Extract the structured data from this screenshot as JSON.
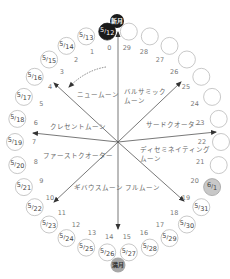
{
  "colors": {
    "new_moon": "#1a1a1a",
    "full_moon": "#a8a8a8",
    "highlight_date": "#c8c8c8",
    "circle_stroke": "#b0b0b0",
    "arrow": "#444444"
  },
  "markers": {
    "new_moon": "新月",
    "full_moon": "満月"
  },
  "days": [
    {
      "day": "0",
      "date_month": "5",
      "date_day": "12",
      "style": "dark"
    },
    {
      "day": "1",
      "date_month": "5",
      "date_day": "13",
      "style": "normal"
    },
    {
      "day": "2",
      "date_month": "5",
      "date_day": "14",
      "style": "normal"
    },
    {
      "day": "3",
      "date_month": "5",
      "date_day": "15",
      "style": "normal"
    },
    {
      "day": "4",
      "date_month": "5",
      "date_day": "16",
      "style": "normal"
    },
    {
      "day": "5",
      "date_month": "5",
      "date_day": "17",
      "style": "normal"
    },
    {
      "day": "6",
      "date_month": "5",
      "date_day": "18",
      "style": "normal"
    },
    {
      "day": "7",
      "date_month": "5",
      "date_day": "19",
      "style": "normal"
    },
    {
      "day": "8",
      "date_month": "5",
      "date_day": "20",
      "style": "normal"
    },
    {
      "day": "9",
      "date_month": "5",
      "date_day": "21",
      "style": "normal"
    },
    {
      "day": "10",
      "date_month": "5",
      "date_day": "22",
      "style": "normal"
    },
    {
      "day": "11",
      "date_month": "5",
      "date_day": "23",
      "style": "normal"
    },
    {
      "day": "12",
      "date_month": "5",
      "date_day": "24",
      "style": "normal"
    },
    {
      "day": "13",
      "date_month": "5",
      "date_day": "25",
      "style": "normal"
    },
    {
      "day": "14",
      "date_month": "5",
      "date_day": "26",
      "style": "normal"
    },
    {
      "day": "15",
      "date_month": "5",
      "date_day": "27",
      "style": "normal"
    },
    {
      "day": "16",
      "date_month": "5",
      "date_day": "28",
      "style": "normal"
    },
    {
      "day": "17",
      "date_month": "5",
      "date_day": "29",
      "style": "normal"
    },
    {
      "day": "18",
      "date_month": "5",
      "date_day": "30",
      "style": "normal"
    },
    {
      "day": "19",
      "date_month": "5",
      "date_day": "31",
      "style": "normal"
    },
    {
      "day": "20",
      "date_month": "6",
      "date_day": "1",
      "style": "highlight"
    },
    {
      "day": "21",
      "date_month": "",
      "date_day": "",
      "style": "empty"
    },
    {
      "day": "22",
      "date_month": "",
      "date_day": "",
      "style": "empty"
    },
    {
      "day": "23",
      "date_month": "",
      "date_day": "",
      "style": "empty"
    },
    {
      "day": "24",
      "date_month": "",
      "date_day": "",
      "style": "empty"
    },
    {
      "day": "25",
      "date_month": "",
      "date_day": "",
      "style": "empty"
    },
    {
      "day": "26",
      "date_month": "",
      "date_day": "",
      "style": "empty"
    },
    {
      "day": "27",
      "date_month": "",
      "date_day": "",
      "style": "empty"
    },
    {
      "day": "28",
      "date_month": "",
      "date_day": "",
      "style": "empty"
    },
    {
      "day": "29",
      "date_month": "",
      "date_day": "",
      "style": "empty"
    }
  ],
  "phases": [
    {
      "id": "new-moon",
      "lines": [
        "ニュームーン"
      ]
    },
    {
      "id": "crescent",
      "lines": [
        "クレセントムーン"
      ]
    },
    {
      "id": "first-quarter",
      "lines": [
        "ファーストクオーター"
      ]
    },
    {
      "id": "gibbous",
      "lines": [
        "ギバウスムーン"
      ]
    },
    {
      "id": "full-moon",
      "lines": [
        "フルムーン"
      ]
    },
    {
      "id": "disseminating",
      "lines": [
        "ディセミネイティング",
        "ムーン"
      ]
    },
    {
      "id": "third-quarter",
      "lines": [
        "サードクオーター"
      ]
    },
    {
      "id": "balsamic",
      "lines": [
        "バルサミック",
        "ムーン"
      ]
    }
  ]
}
